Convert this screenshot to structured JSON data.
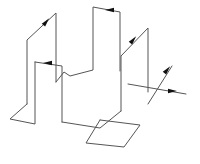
{
  "diagram": {
    "type": "3d-wire-path",
    "colors": {
      "background": "#ffffff",
      "line": "#555555",
      "arrow": "#111111"
    },
    "segments": [
      {
        "id": "left-foot",
        "points": [
          [
            27,
            104
          ],
          [
            10,
            119
          ],
          [
            35,
            124
          ],
          [
            35,
            62
          ]
        ]
      },
      {
        "id": "left-tall-front",
        "points": [
          [
            27,
            104
          ],
          [
            27,
            40
          ],
          [
            56,
            13
          ],
          [
            56,
            82
          ]
        ]
      },
      {
        "id": "inner-step",
        "points": [
          [
            35,
            62
          ],
          [
            62,
            66
          ],
          [
            62,
            122
          ]
        ]
      },
      {
        "id": "center-zigzag",
        "points": [
          [
            56,
            82
          ],
          [
            64,
            72
          ],
          [
            70,
            76
          ],
          [
            93,
            70
          ],
          [
            93,
            7
          ],
          [
            120,
            12
          ],
          [
            120,
            71
          ]
        ]
      },
      {
        "id": "right-frame",
        "points": [
          [
            121,
            111
          ],
          [
            121,
            56
          ],
          [
            148,
            28
          ],
          [
            148,
            92
          ]
        ]
      },
      {
        "id": "base-route",
        "points": [
          [
            62,
            122
          ],
          [
            100,
            128
          ],
          [
            121,
            111
          ]
        ]
      },
      {
        "id": "bottom-square",
        "points": [
          [
            100,
            120
          ],
          [
            140,
            125
          ],
          [
            124,
            147
          ],
          [
            86,
            143
          ],
          [
            100,
            120
          ]
        ]
      },
      {
        "id": "right-tail",
        "points": [
          [
            128,
            84
          ],
          [
            186,
            94
          ]
        ]
      },
      {
        "id": "right-diagonal",
        "points": [
          [
            148,
            104
          ],
          [
            172,
            66
          ]
        ]
      }
    ],
    "arrows": [
      {
        "id": "arrow-left-diagonal",
        "at": [
          46,
          22
        ],
        "direction": "up-right"
      },
      {
        "id": "arrow-inner-step",
        "at": [
          48,
          63
        ],
        "direction": "left"
      },
      {
        "id": "arrow-top",
        "at": [
          110,
          10
        ],
        "direction": "left"
      },
      {
        "id": "arrow-right-diagonal",
        "at": [
          133,
          40
        ],
        "direction": "up-right"
      },
      {
        "id": "arrow-right-tail",
        "at": [
          172,
          91
        ],
        "direction": "right"
      },
      {
        "id": "arrow-right-upper",
        "at": [
          167,
          70
        ],
        "direction": "up-right"
      }
    ]
  }
}
